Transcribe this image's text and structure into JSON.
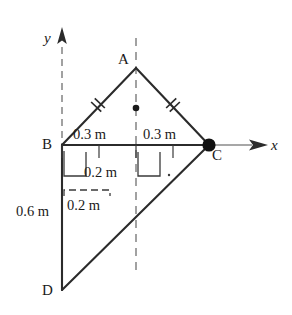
{
  "figure": {
    "vertices": [
      {
        "name": "A",
        "label": "A",
        "x": 136,
        "y": 68,
        "label_x": 118,
        "label_y": 52
      },
      {
        "name": "B",
        "label": "B",
        "x": 62,
        "y": 145,
        "label_x": 42,
        "label_y": 137
      },
      {
        "name": "C",
        "label": "C",
        "x": 209,
        "y": 145,
        "label_x": 212,
        "label_y": 148
      },
      {
        "name": "D",
        "label": "D",
        "x": 62,
        "y": 290,
        "label_x": 42,
        "label_y": 283
      }
    ],
    "axes": {
      "x_label": "x",
      "x_label_pos": {
        "x": 271,
        "y": 138
      },
      "y_label": "y",
      "y_label_pos": {
        "x": 44,
        "y": 31
      },
      "x_axis": {
        "x1": 62,
        "y1": 145,
        "x2": 264,
        "y2": 145
      },
      "y_axis_dashed": {
        "x": 62,
        "y1": 45,
        "y2": 145
      },
      "y_arrow_tip": {
        "x": 62,
        "y": 28
      },
      "x_arrow_tip": {
        "x": 267,
        "y": 145
      }
    },
    "center_line": {
      "x": 136,
      "y1": 40,
      "y2": 272
    },
    "centroid_marker": {
      "x": 136,
      "y": 108,
      "r": 3.2
    },
    "point_c_marker": {
      "x": 209,
      "y": 145,
      "r": 6.5
    },
    "equal_tick_marks": [
      {
        "name": "tick-BA",
        "x": 98,
        "y": 105,
        "angle": -46
      },
      {
        "name": "tick-AC",
        "x": 173,
        "y": 105,
        "angle": 45
      }
    ],
    "dimensions": [
      {
        "name": "dim-0p3-left",
        "text": "0.3 m",
        "x": 73,
        "y": 127
      },
      {
        "name": "dim-0p3-right",
        "text": "0.3 m",
        "x": 143,
        "y": 127
      },
      {
        "name": "dim-0p2-upper",
        "text": "0.2 m",
        "x": 84,
        "y": 165
      },
      {
        "name": "dim-0p2-lower",
        "text": "0.2 m",
        "x": 67,
        "y": 198
      },
      {
        "name": "dim-0p6",
        "text": "0.6 m",
        "x": 16,
        "y": 204
      }
    ],
    "colors": {
      "ink": "#1a1a1a",
      "outline": "#2b2b2b",
      "axis": "#6e6e6e",
      "dash": "#8a8a8a",
      "dim": "#3a3a3a",
      "background": "#ffffff"
    }
  }
}
